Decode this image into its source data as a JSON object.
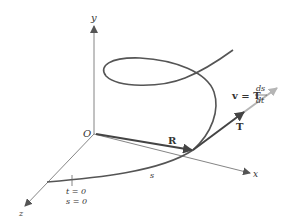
{
  "diagram": {
    "axes": {
      "x_label": "x",
      "y_label": "y",
      "z_label": "z",
      "origin_label": "O"
    },
    "vectors": {
      "position_label": "R",
      "tangent_label": "T",
      "velocity_lhs": "v = T",
      "velocity_num": "ds",
      "velocity_den": "dt"
    },
    "curve": {
      "arc_length_label": "s",
      "start_t": "t = 0",
      "start_s": "s = 0"
    },
    "colors": {
      "curve": "#555555",
      "axis": "#666666",
      "vector": "#444444",
      "velocity": "#b5b5b5"
    }
  }
}
